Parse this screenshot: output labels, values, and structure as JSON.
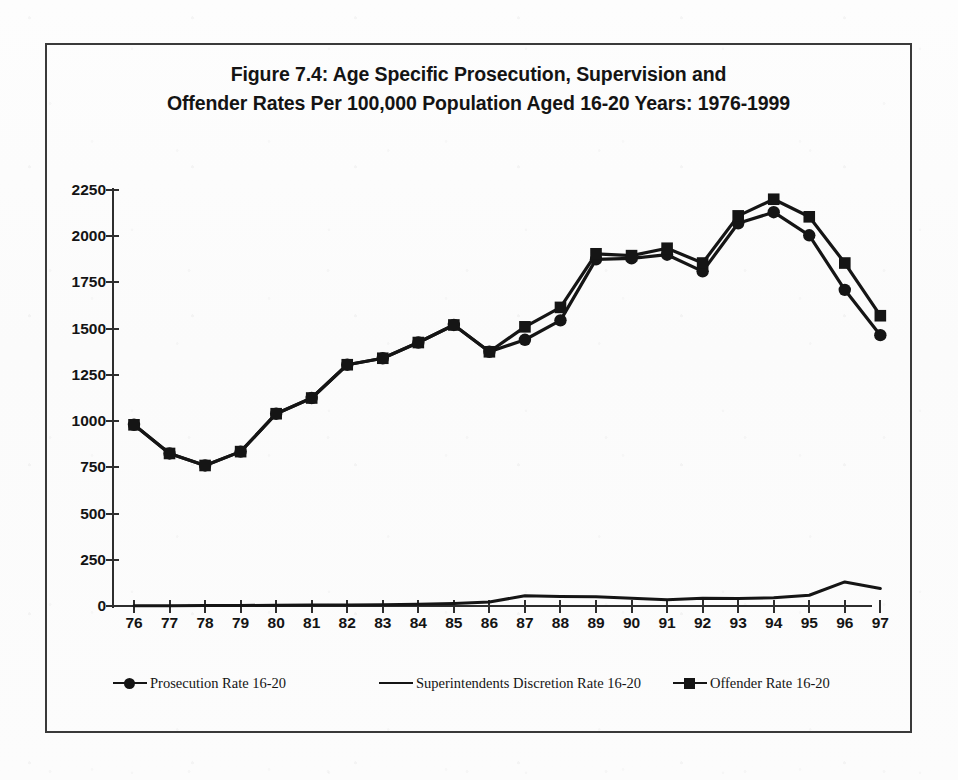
{
  "figure": {
    "title_line1": "Figure 7.4: Age Specific Prosecution, Supervision and",
    "title_line2": "Offender Rates Per 100,000 Population Aged 16-20 Years: 1976-1999"
  },
  "legend": {
    "position": "bottom",
    "entries": [
      {
        "label": "Prosecution Rate 16-20",
        "marker": "circle-marker-icon",
        "color": "#151515"
      },
      {
        "label": "Superintendents Discretion Rate 16-20",
        "marker": "line-marker-icon",
        "color": "#151515"
      },
      {
        "label": "Offender Rate 16-20",
        "marker": "square-marker-icon",
        "color": "#151515"
      }
    ]
  },
  "axes": {
    "y_ticks": [
      "0",
      "250",
      "500",
      "750",
      "1000",
      "1250",
      "1500",
      "1750",
      "2000",
      "2250"
    ],
    "x_ticks": [
      "76",
      "77",
      "78",
      "79",
      "80",
      "81",
      "82",
      "83",
      "84",
      "85",
      "86",
      "87",
      "88",
      "89",
      "90",
      "91",
      "92",
      "93",
      "94",
      "95",
      "96",
      "97"
    ]
  },
  "chart_data": {
    "type": "line",
    "title": "Figure 7.4: Age Specific Prosecution, Supervision and Offender Rates Per 100,000 Population Aged 16-20 Years: 1976-1999",
    "xlabel": "",
    "ylabel": "",
    "x": [
      "76",
      "77",
      "78",
      "79",
      "80",
      "81",
      "82",
      "83",
      "84",
      "85",
      "86",
      "87",
      "88",
      "89",
      "90",
      "91",
      "92",
      "93",
      "94",
      "95",
      "96",
      "97"
    ],
    "ylim": [
      0,
      2250
    ],
    "ytick_step": 250,
    "grid": false,
    "legend_position": "bottom",
    "series": [
      {
        "name": "Prosecution Rate 16-20",
        "marker": "circle",
        "color": "#151515",
        "values": [
          980,
          825,
          760,
          835,
          1040,
          1125,
          1305,
          1340,
          1425,
          1520,
          1375,
          1440,
          1545,
          1875,
          1880,
          1900,
          1810,
          2070,
          2130,
          2005,
          1710,
          1465
        ]
      },
      {
        "name": "Superintendents Discretion Rate 16-20",
        "marker": "none",
        "color": "#151515",
        "values": [
          2,
          2,
          3,
          3,
          4,
          5,
          6,
          7,
          10,
          14,
          22,
          55,
          52,
          50,
          42,
          34,
          42,
          40,
          45,
          58,
          130,
          95
        ]
      },
      {
        "name": "Offender Rate 16-20",
        "marker": "square",
        "color": "#151515",
        "values": [
          980,
          825,
          760,
          835,
          1040,
          1125,
          1305,
          1340,
          1425,
          1520,
          1375,
          1510,
          1615,
          1905,
          1895,
          1935,
          1855,
          2110,
          2200,
          2105,
          1855,
          1570
        ]
      }
    ]
  }
}
